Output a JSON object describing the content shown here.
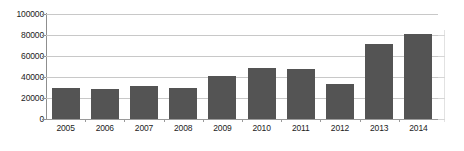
{
  "chart_data": {
    "type": "bar",
    "title": "",
    "subtitle": "",
    "xlabel": "",
    "ylabel": "",
    "categories": [
      "2005",
      "2006",
      "2007",
      "2008",
      "2009",
      "2010",
      "2011",
      "2012",
      "2013",
      "2014"
    ],
    "values": [
      29500,
      28500,
      31000,
      29500,
      41000,
      49000,
      48000,
      33500,
      71000,
      80500
    ],
    "series": [
      {
        "name": "",
        "values": [
          29500,
          28500,
          31000,
          29500,
          41000,
          49000,
          48000,
          33500,
          71000,
          80500
        ]
      }
    ],
    "ylim": [
      0,
      100000
    ],
    "ytick_values": [
      0,
      20000,
      40000,
      60000,
      80000,
      100000
    ],
    "ytick_labels": [
      "0",
      "20000",
      "40000",
      "60000",
      "80000",
      "100000"
    ],
    "grid": true,
    "grid_axis": "y",
    "legend": false,
    "legend_position": "none",
    "annotations": [],
    "colors": {
      "bar_fill": "#545454",
      "gridline": "#c8c8c8",
      "axis_line": "#8f8f8f",
      "baseline": "#9a9a9a",
      "tick_label": "#1c1c1c",
      "background": "#ffffff",
      "right_axis_faint": "#e2e2e2"
    }
  }
}
